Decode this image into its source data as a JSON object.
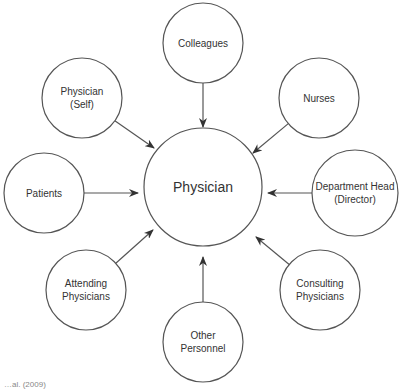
{
  "diagram": {
    "center": {
      "label": "Physician",
      "x": 203,
      "y": 187,
      "r": 59
    },
    "nodes": [
      {
        "id": "colleagues",
        "lines": [
          "Colleagues"
        ],
        "x": 203,
        "y": 43,
        "r": 40,
        "arrow_to": [
          203,
          127
        ]
      },
      {
        "id": "physician-self",
        "lines": [
          "Physician",
          "(Self)"
        ],
        "x": 82,
        "y": 98,
        "r": 40,
        "arrow_to": [
          154,
          148
        ]
      },
      {
        "id": "nurses",
        "lines": [
          "Nurses"
        ],
        "x": 319,
        "y": 98,
        "r": 40,
        "arrow_to": [
          253,
          153
        ]
      },
      {
        "id": "patients",
        "lines": [
          "Patients"
        ],
        "x": 44,
        "y": 193,
        "r": 40,
        "arrow_to": [
          138,
          193
        ]
      },
      {
        "id": "department-head",
        "lines": [
          "Department Head",
          "(Director)"
        ],
        "x": 355,
        "y": 193,
        "r": 43,
        "arrow_to": [
          268,
          193
        ]
      },
      {
        "id": "attending-physicians",
        "lines": [
          "Attending",
          "Physicians"
        ],
        "x": 86,
        "y": 290,
        "r": 40,
        "arrow_to": [
          153,
          230
        ]
      },
      {
        "id": "other-personnel",
        "lines": [
          "Other",
          "Personnel"
        ],
        "x": 203,
        "y": 342,
        "r": 40,
        "arrow_to": [
          203,
          257
        ]
      },
      {
        "id": "consulting-physicians",
        "lines": [
          "Consulting",
          "Physicians"
        ],
        "x": 320,
        "y": 290,
        "r": 40,
        "arrow_to": [
          256,
          237
        ]
      }
    ]
  },
  "footnote": "…al. (2009)"
}
